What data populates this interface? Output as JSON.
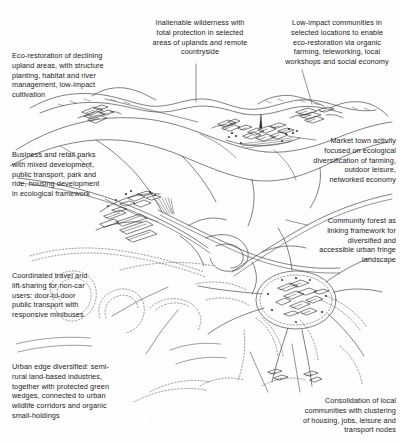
{
  "figure": {
    "medium": "pen-and-ink line drawing",
    "ink_color": "#222222",
    "paper_color": "#fefefe"
  },
  "annotations": [
    {
      "id": "eco-restoration",
      "text": "Eco-restoration of declining\nupland areas, with structure\nplanting, habitat and river\nmanagement, low-impact\ncultivation",
      "align": "left",
      "x": 12,
      "y": 51,
      "w": 140
    },
    {
      "id": "inalienable-wilderness",
      "text": "Inalienable wilderness with\ntotal protection in selected\nareas of uplands and remote\ncountryside",
      "align": "center",
      "x": 141,
      "y": 18,
      "w": 118
    },
    {
      "id": "low-impact-communities",
      "text": "Low-impact communities in\nselected locations to enable\neco-restoration via organic\nfarming, teleworking, local\nworkshops and social economy",
      "align": "center",
      "x": 276,
      "y": 18,
      "w": 122
    },
    {
      "id": "business-retail-parks",
      "text": "Business and retail parks\nwith mixed development,\npublic transport, park and\nride, housing development\nin ecological framework",
      "align": "left",
      "x": 12,
      "y": 150,
      "w": 130
    },
    {
      "id": "market-town-activity",
      "text": "Market town activity\nfocused on ecological\ndiversification of farming,\noutdoor leisure,\nnetworked economy",
      "align": "right",
      "x": 300,
      "y": 136,
      "w": 96
    },
    {
      "id": "community-forest",
      "text": "Community forest as\nlinking framework for\ndiversified and\naccessible urban fringe\nlandscape",
      "align": "right",
      "x": 300,
      "y": 216,
      "w": 96
    },
    {
      "id": "coordinated-travel",
      "text": "Coordinated travel and\nlift-sharing for non-car\nusers: door-to-door\npublic transport with\nresponsive minibuses",
      "align": "left",
      "x": 12,
      "y": 271,
      "w": 108
    },
    {
      "id": "urban-edge-diversified",
      "text": "Urban edge diversified: semi-\nrural land-based industries,\ntogether with protected green\nwedges, connected to urban\nwildlife corridors and organic\nsmall-holdings",
      "align": "left",
      "x": 12,
      "y": 362,
      "w": 132
    },
    {
      "id": "consolidation-local-communities",
      "text": "Consolidation of local\ncommunities with clustering\nof housing, jobs, leisure and\ntransport nodes",
      "align": "right",
      "x": 256,
      "y": 396,
      "w": 140
    }
  ],
  "leader_lines": [
    {
      "id": "leader-eco-restoration",
      "points": "105,99 150,110 198,122"
    },
    {
      "id": "leader-inalienable-wilderness",
      "points": "196,64 196,102"
    },
    {
      "id": "leader-low-impact",
      "points": "302,70 312,104"
    },
    {
      "id": "leader-business-retail",
      "points": "105,199 135,214 158,222"
    },
    {
      "id": "leader-market-town",
      "points": "316,140 300,138 288,136"
    },
    {
      "id": "leader-community-forest",
      "points": "307,225 294,222 286,220"
    },
    {
      "id": "leader-coordinated-travel",
      "points": "112,316 140,300 168,287"
    },
    {
      "id": "leader-urban-edge",
      "points": "146,354 162,330 178,310"
    },
    {
      "id": "leader-consolidation",
      "points": "268,392 258,370 250,352"
    },
    {
      "id": "leader-consolidation-2",
      "points": "300,392 296,368 292,344"
    }
  ],
  "sketch_elements": {
    "hills": "rolling upland ridges across upper third",
    "market_town": "church-spire town cluster on mid-right ridge",
    "business_park": "block buildings and sheds at left centre",
    "motorway_junction": "interchange with curving slip roads at centre",
    "hedgerow_corridors": "dotted tree-belt loops across lower half",
    "town_core": "dense settlement node at lower right",
    "radial_corridors": "spoke-like green corridors radiating from town core"
  }
}
